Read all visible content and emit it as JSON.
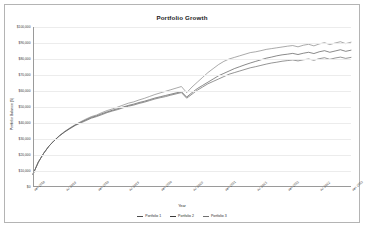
{
  "chart": {
    "title": "Portfolio Growth",
    "xlabel": "Year",
    "ylabel": "Portfolio Balance ($)"
  },
  "legend": {
    "items": [
      {
        "label": "Portfolio 1",
        "color": "#4d4d4d"
      },
      {
        "label": "Portfolio 2",
        "color": "#3a3a3a"
      },
      {
        "label": "Portfolio 3",
        "color": "#707070"
      }
    ]
  },
  "chart_data": {
    "type": "line",
    "title": "Portfolio Growth",
    "xlabel": "Year",
    "ylabel": "Portfolio Balance ($)",
    "grid": true,
    "legend_position": "bottom",
    "ylim": [
      0,
      100000
    ],
    "yticks": [
      0,
      10000,
      20000,
      30000,
      40000,
      50000,
      60000,
      70000,
      80000,
      90000,
      100000
    ],
    "ytick_labels": [
      "$0",
      "$10,000",
      "$20,000",
      "$30,000",
      "$40,000",
      "$50,000",
      "$60,000",
      "$70,000",
      "$80,000",
      "$90,000",
      "$100,000"
    ],
    "xticks": [
      "Jan 2018",
      "Jul 2018",
      "Jan 2019",
      "Jul 2019",
      "Jan 2020",
      "Jul 2020",
      "Jan 2021",
      "Jul 2021",
      "Jan 2022",
      "Jul 2022",
      "Jan 2023"
    ],
    "x": [
      "2018-01",
      "2018-02",
      "2018-03",
      "2018-04",
      "2018-05",
      "2018-06",
      "2018-07",
      "2018-08",
      "2018-09",
      "2018-10",
      "2018-11",
      "2018-12",
      "2019-01",
      "2019-02",
      "2019-03",
      "2019-04",
      "2019-05",
      "2019-06",
      "2019-07",
      "2019-08",
      "2019-09",
      "2019-10",
      "2019-11",
      "2019-12",
      "2020-01",
      "2020-02",
      "2020-03",
      "2020-04",
      "2020-05",
      "2020-06",
      "2020-07",
      "2020-08",
      "2020-09",
      "2020-10",
      "2020-11",
      "2020-12",
      "2021-01",
      "2021-02",
      "2021-03",
      "2021-04",
      "2021-05",
      "2021-06",
      "2021-07",
      "2021-08",
      "2021-09",
      "2021-10",
      "2021-11",
      "2021-12",
      "2022-01",
      "2022-02",
      "2022-03",
      "2022-04",
      "2022-05",
      "2022-06",
      "2022-07",
      "2022-08",
      "2022-09",
      "2022-10",
      "2022-11",
      "2022-12",
      "2023-01"
    ],
    "series": [
      {
        "name": "Portfolio 1",
        "color": "#4d4d4d",
        "values": [
          8000,
          15500,
          21000,
          25500,
          29000,
          32000,
          34500,
          36500,
          38500,
          40000,
          41500,
          43000,
          44000,
          45200,
          46500,
          47500,
          48400,
          49500,
          50500,
          51200,
          52200,
          53000,
          54000,
          55000,
          55800,
          56500,
          57400,
          58200,
          59000,
          55500,
          58000,
          60500,
          62500,
          64500,
          66000,
          67500,
          69000,
          70500,
          71500,
          72500,
          73500,
          74500,
          75200,
          76000,
          76800,
          77500,
          78000,
          78600,
          79000,
          79400,
          78800,
          79500,
          80000,
          79200,
          80200,
          80800,
          79800,
          80600,
          81200,
          80400,
          81000
        ]
      },
      {
        "name": "Portfolio 2",
        "color": "#3a3a3a",
        "values": [
          8000,
          15500,
          21000,
          25500,
          29000,
          32000,
          34500,
          36800,
          38800,
          40500,
          42000,
          43500,
          44500,
          45800,
          47000,
          48000,
          49000,
          50000,
          51000,
          51800,
          52800,
          53600,
          54600,
          55600,
          56400,
          57200,
          58000,
          58800,
          59600,
          56200,
          59000,
          61500,
          63500,
          65500,
          67500,
          69500,
          71000,
          72500,
          74000,
          75200,
          76400,
          77500,
          78500,
          79500,
          80500,
          81200,
          82000,
          82600,
          83000,
          83500,
          82800,
          83600,
          84200,
          83400,
          84500,
          85200,
          84200,
          85000,
          85800,
          84800,
          85500
        ]
      },
      {
        "name": "Portfolio 3",
        "color": "#707070",
        "values": [
          8000,
          15500,
          21000,
          25500,
          29000,
          32200,
          34800,
          37000,
          39000,
          40800,
          42500,
          44000,
          45000,
          46500,
          47800,
          48800,
          50000,
          51200,
          52400,
          53200,
          54400,
          55400,
          56600,
          57800,
          58800,
          59800,
          60800,
          61800,
          62800,
          59000,
          62500,
          65500,
          68500,
          71500,
          74000,
          76500,
          78500,
          80000,
          81000,
          82000,
          83000,
          84000,
          84500,
          85200,
          86000,
          86500,
          87000,
          87500,
          88000,
          88400,
          87600,
          88600,
          89200,
          88200,
          89400,
          90200,
          89000,
          90000,
          90800,
          89600,
          90500
        ]
      }
    ]
  }
}
